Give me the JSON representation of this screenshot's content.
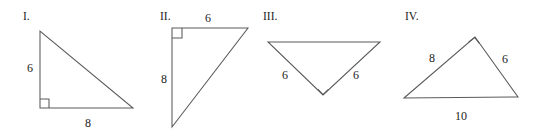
{
  "figure": {
    "items": [
      {
        "id": "I",
        "label": "I.",
        "label_pos": {
          "x": 23,
          "y": 20
        },
        "shape": "right-triangle",
        "points": "40,31 40,108 133,108",
        "right_angle": {
          "type": "square",
          "d": "M40,99 L49,99 L49,108"
        },
        "sides": [
          {
            "name": "leg-vertical",
            "value": "6",
            "x": 27,
            "y": 72,
            "anchor": "start"
          },
          {
            "name": "leg-horizontal",
            "value": "8",
            "x": 88,
            "y": 127,
            "anchor": "middle"
          }
        ]
      },
      {
        "id": "II",
        "label": "II.",
        "label_pos": {
          "x": 160,
          "y": 20
        },
        "shape": "right-triangle",
        "points": "172,28 248,28 172,127",
        "right_angle": {
          "type": "square",
          "d": "M172,38 L182,38 L182,28"
        },
        "sides": [
          {
            "name": "leg-top",
            "value": "6",
            "x": 208,
            "y": 22,
            "anchor": "middle"
          },
          {
            "name": "leg-left",
            "value": "8",
            "x": 161,
            "y": 83,
            "anchor": "start"
          }
        ]
      },
      {
        "id": "III",
        "label": "III.",
        "label_pos": {
          "x": 263,
          "y": 20
        },
        "shape": "right-triangle",
        "points": "268,42 380,42 323,95",
        "right_angle": {
          "type": "diamond",
          "d": "M317.8,89.2 L323,94.6 L328.4,89.4"
        },
        "sides": [
          {
            "name": "leg-left",
            "value": "6",
            "x": 285,
            "y": 79,
            "anchor": "middle"
          },
          {
            "name": "leg-right",
            "value": "6",
            "x": 356,
            "y": 79,
            "anchor": "middle"
          }
        ]
      },
      {
        "id": "IV",
        "label": "IV.",
        "label_pos": {
          "x": 405,
          "y": 20
        },
        "shape": "right-triangle",
        "points": "404,98 475,37 518,97",
        "right_angle": {
          "type": "diamond",
          "d": "M468.6,42.2 L474.6,37.5 L479.6,43.6"
        },
        "sides": [
          {
            "name": "leg-upper-left",
            "value": "8",
            "x": 432,
            "y": 62,
            "anchor": "middle"
          },
          {
            "name": "leg-upper-right",
            "value": "6",
            "x": 505,
            "y": 63,
            "anchor": "middle"
          },
          {
            "name": "base",
            "value": "10",
            "x": 461,
            "y": 120,
            "anchor": "middle"
          }
        ]
      }
    ]
  },
  "colors": {
    "stroke": "#5a5a5a",
    "text": "#1c1c1c",
    "background": "#ffffff"
  }
}
